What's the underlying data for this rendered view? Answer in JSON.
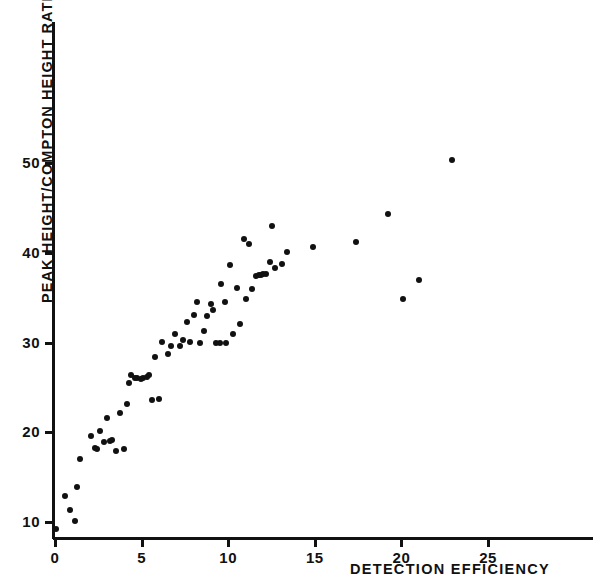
{
  "chart_data": {
    "type": "scatter",
    "title": "",
    "xlabel": "DETECTION EFFICIENCY",
    "ylabel": "PEAK HEIGHT/COMPTON HEIGHT RATIO",
    "xlim": [
      0,
      31.2
    ],
    "ylim": [
      8.3,
      57.5
    ],
    "xticks": [
      0,
      5,
      10,
      15,
      20,
      25
    ],
    "yticks": [
      10,
      20,
      30,
      40,
      50
    ],
    "xticklabels": [
      "0",
      "5",
      "10",
      "15",
      "20",
      "25"
    ],
    "yticklabels": [
      "10",
      "20",
      "30",
      "40",
      "50"
    ],
    "grid": false,
    "legend": null,
    "marker": "filled-circle",
    "marker_color": "#111111",
    "points": [
      [
        0.05,
        9.2
      ],
      [
        0.55,
        12.9
      ],
      [
        0.85,
        11.3
      ],
      [
        1.15,
        10.1
      ],
      [
        1.25,
        13.9
      ],
      [
        1.45,
        17.0
      ],
      [
        2.1,
        19.6
      ],
      [
        2.3,
        18.3
      ],
      [
        2.45,
        18.1
      ],
      [
        2.6,
        20.1
      ],
      [
        2.85,
        18.9
      ],
      [
        3.0,
        21.6
      ],
      [
        3.15,
        19.0
      ],
      [
        3.3,
        19.1
      ],
      [
        3.55,
        17.9
      ],
      [
        3.75,
        22.1
      ],
      [
        4.0,
        18.1
      ],
      [
        4.15,
        23.1
      ],
      [
        4.3,
        25.5
      ],
      [
        4.4,
        26.4
      ],
      [
        4.6,
        26.0
      ],
      [
        4.75,
        26.1
      ],
      [
        4.95,
        25.9
      ],
      [
        5.1,
        26.1
      ],
      [
        5.3,
        26.2
      ],
      [
        5.45,
        26.4
      ],
      [
        5.6,
        23.6
      ],
      [
        5.8,
        28.4
      ],
      [
        6.0,
        23.7
      ],
      [
        6.2,
        30.1
      ],
      [
        6.5,
        28.7
      ],
      [
        6.7,
        29.6
      ],
      [
        6.9,
        31.0
      ],
      [
        7.2,
        29.6
      ],
      [
        7.4,
        30.3
      ],
      [
        7.6,
        32.3
      ],
      [
        7.8,
        30.1
      ],
      [
        8.0,
        33.1
      ],
      [
        8.2,
        34.5
      ],
      [
        8.4,
        30.0
      ],
      [
        8.6,
        31.3
      ],
      [
        8.8,
        33.0
      ],
      [
        9.0,
        34.3
      ],
      [
        9.1,
        33.6
      ],
      [
        9.3,
        30.0
      ],
      [
        9.5,
        30.0
      ],
      [
        9.6,
        36.5
      ],
      [
        9.8,
        34.5
      ],
      [
        9.9,
        29.9
      ],
      [
        10.1,
        38.6
      ],
      [
        10.3,
        31.0
      ],
      [
        10.5,
        36.1
      ],
      [
        10.7,
        32.1
      ],
      [
        10.9,
        41.5
      ],
      [
        11.0,
        34.8
      ],
      [
        11.2,
        41.0
      ],
      [
        11.4,
        36.0
      ],
      [
        11.6,
        37.4
      ],
      [
        11.8,
        37.5
      ],
      [
        11.9,
        37.5
      ],
      [
        12.0,
        37.6
      ],
      [
        12.2,
        37.6
      ],
      [
        12.4,
        39.0
      ],
      [
        12.5,
        43.0
      ],
      [
        12.7,
        38.3
      ],
      [
        13.1,
        38.8
      ],
      [
        13.4,
        40.1
      ],
      [
        14.9,
        40.6
      ],
      [
        17.4,
        41.2
      ],
      [
        19.2,
        44.3
      ],
      [
        20.1,
        34.9
      ],
      [
        21.0,
        37.0
      ],
      [
        22.9,
        50.3
      ]
    ]
  },
  "axis": {
    "y_title": "PEAK HEIGHT/COMPTON HEIGHT RATIO",
    "x_title": "DETECTION EFFICIENCY"
  }
}
